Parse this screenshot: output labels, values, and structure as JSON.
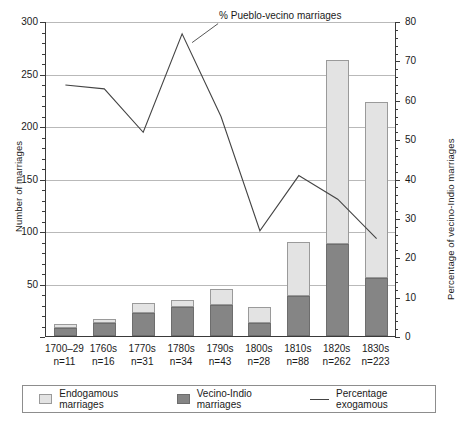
{
  "chart_data": {
    "type": "bar",
    "title": "",
    "subtitle": "",
    "xlabel": "",
    "ylabel": "Number of marriages",
    "y2label": "Percentage of vecino-Indio marriages",
    "ylim": [
      0,
      300
    ],
    "y2lim": [
      0,
      80
    ],
    "yticks": [
      0,
      50,
      100,
      150,
      200,
      250,
      300
    ],
    "y2ticks": [
      0,
      10,
      20,
      30,
      40,
      50,
      60,
      70,
      80
    ],
    "grid": true,
    "legend_position": "bottom",
    "stacked": true,
    "categories": [
      "1700–29",
      "1760s",
      "1770s",
      "1780s",
      "1790s",
      "1800s",
      "1810s",
      "1820s",
      "1830s"
    ],
    "sample_sizes": [
      "n=11",
      "n=16",
      "n=31",
      "n=34",
      "n=43",
      "n=28",
      "n=88",
      "n=262",
      "n=223"
    ],
    "series": [
      {
        "name": "Vecino-Indio marriages",
        "axis": "left",
        "color": "#858585",
        "values": [
          8,
          12,
          22,
          28,
          30,
          12,
          38,
          88,
          55
        ]
      },
      {
        "name": "Endogamous marriages",
        "axis": "left",
        "color": "#e3e3e3",
        "values": [
          3,
          4,
          9,
          6,
          15,
          16,
          52,
          175,
          168
        ]
      },
      {
        "name": "Percentage exogamous",
        "axis": "right",
        "color": "#444444",
        "type": "line",
        "values": [
          64,
          63,
          52,
          77,
          56,
          27,
          41,
          35,
          25
        ]
      }
    ],
    "totals": [
      11,
      16,
      31,
      34,
      45,
      28,
      90,
      263,
      223
    ],
    "annotations": [
      {
        "text": "% Pueblo-vecino marriages",
        "x": "1780s",
        "y": 74
      }
    ]
  },
  "axes": {
    "left": {
      "title": "Number of marriages",
      "ticks": [
        "300",
        "250",
        "200",
        "150",
        "100",
        "50",
        ""
      ]
    },
    "right": {
      "title": "Percentage of vecino-Indio marriages",
      "ticks": [
        "80",
        "70",
        "60",
        "50",
        "40",
        "30",
        "20",
        "10",
        "0"
      ]
    }
  },
  "legend": {
    "items": [
      {
        "label": "Endogamous marriages",
        "swatch": "endo"
      },
      {
        "label": "Vecino-Indio marriages",
        "swatch": "vec"
      },
      {
        "label": "Percentage exogamous",
        "swatch": "line"
      }
    ]
  },
  "annotation": {
    "label": "% Pueblo-vecino marriages"
  }
}
